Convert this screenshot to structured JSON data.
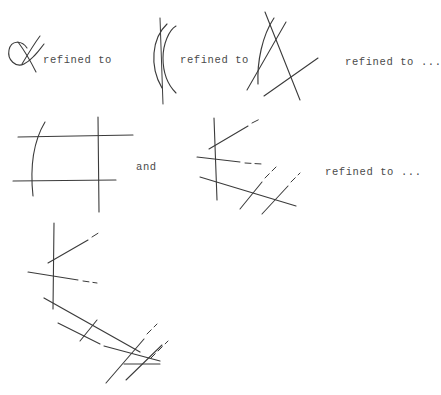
{
  "figure": {
    "background_color": "#ffffff",
    "ink_color": "#3b3b3b",
    "labels": {
      "refined_to_1": "refined to",
      "refined_to_2": "refined to",
      "refined_to_3": "refined to ...",
      "and": "and",
      "refined_to_4": "refined to ..."
    },
    "rows": [
      {
        "name": "row-1",
        "panels": [
          {
            "name": "alpha-loop-sketch",
            "description": "small loop with crossing stroke (alpha shape)"
          },
          {
            "name": "arc-with-vertical-line-sketch",
            "description": "arc crossed by a vertical line"
          },
          {
            "name": "arc-with-two-chords-sketch",
            "description": "arc crossed by two straight chords forming a triangle-like figure"
          }
        ]
      },
      {
        "name": "row-2",
        "panels": [
          {
            "name": "grid-with-arc-sketch",
            "description": "two horizontal and two vertical lines crossed by an arc"
          },
          {
            "name": "dashed-crossings-sketch",
            "description": "vertical line and oblique lines with dashed extensions"
          }
        ]
      },
      {
        "name": "row-3",
        "panels": [
          {
            "name": "chain-of-crossings-sketch",
            "description": "long chain of crossing line segments with dashed extensions"
          }
        ]
      }
    ]
  }
}
